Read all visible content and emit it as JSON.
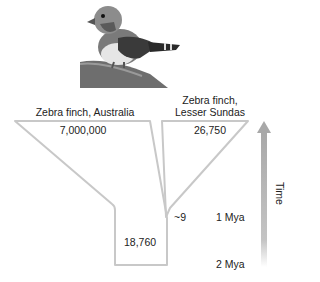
{
  "figure": {
    "image_alt": "zebra finch perched on branch",
    "populations": [
      {
        "name": "Zebra finch, Australia",
        "size": "7,000,000"
      },
      {
        "name_line1": "Zebra finch,",
        "name_line2": "Lesser Sundas",
        "size": "26,750"
      }
    ],
    "ancestral_size": "18,760",
    "founder_size": "~9",
    "time_axis": {
      "label": "Time",
      "ticks": [
        "1 Mya",
        "2 Mya"
      ]
    },
    "colors": {
      "outline": "#c8c8c8",
      "arrow": "#b0b0b0"
    }
  }
}
